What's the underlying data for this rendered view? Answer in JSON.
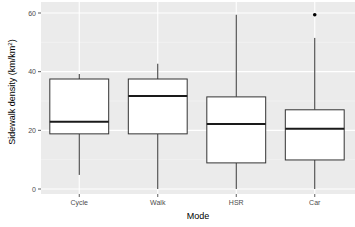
{
  "chart_data": {
    "type": "boxplot",
    "title": "",
    "xlabel": "Mode",
    "ylabel": "Sidewalk density (km/km²)",
    "ylim": [
      0,
      60
    ],
    "yticks": [
      0,
      20,
      40,
      60
    ],
    "grid": true,
    "legend": null,
    "categories": [
      "Cycle",
      "Walk",
      "HSR",
      "Car"
    ],
    "boxes": [
      {
        "category": "Cycle",
        "whisker_low": 4.8,
        "q1": 18.8,
        "median": 22.9,
        "q3": 37.5,
        "whisker_high": 39.2,
        "outliers": []
      },
      {
        "category": "Walk",
        "whisker_low": 0,
        "q1": 18.8,
        "median": 31.7,
        "q3": 37.5,
        "whisker_high": 42.7,
        "outliers": []
      },
      {
        "category": "HSR",
        "whisker_low": 0,
        "q1": 8.9,
        "median": 22.2,
        "q3": 31.4,
        "whisker_high": 59.4,
        "outliers": []
      },
      {
        "category": "Car",
        "whisker_low": 0,
        "q1": 9.9,
        "median": 20.5,
        "q3": 27.0,
        "whisker_high": 51.5,
        "outliers": [
          59.4
        ]
      }
    ]
  },
  "style": {
    "panel_bg": "#ebebeb",
    "grid_major": "#ffffff",
    "box_fill": "#ffffff",
    "box_stroke": "#333333",
    "median_stroke": "#1a1a1a"
  }
}
